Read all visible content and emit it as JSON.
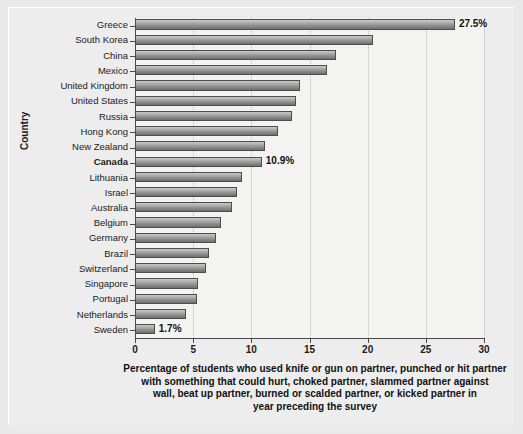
{
  "chart_data": {
    "type": "bar",
    "orientation": "horizontal",
    "title": "",
    "xlabel": "Percentage of students who used knife or gun on partner, punched or hit partner with something that could hurt, choked partner, slammed partner against wall, beat up partner, burned or scalded partner, or kicked partner in year preceding the survey",
    "ylabel": "Country",
    "xlim": [
      0,
      30
    ],
    "xticks": [
      0,
      5,
      10,
      15,
      20,
      25,
      30
    ],
    "xtick_labels": [
      "0",
      "5",
      "10",
      "15",
      "20",
      "25",
      "30"
    ],
    "grid": "vertical-dotted",
    "legend": "none",
    "categories": [
      "Greece",
      "South Korea",
      "China",
      "Mexico",
      "United Kingdom",
      "United States",
      "Russia",
      "Hong Kong",
      "New Zealand",
      "Canada",
      "Lithuania",
      "Israel",
      "Australia",
      "Belgium",
      "Germany",
      "Brazil",
      "Switzerland",
      "Singapore",
      "Portugal",
      "Netherlands",
      "Sweden"
    ],
    "values": [
      27.5,
      20.5,
      17.3,
      16.5,
      14.2,
      13.8,
      13.5,
      12.3,
      11.2,
      10.9,
      9.2,
      8.8,
      8.3,
      7.4,
      7.0,
      6.4,
      6.1,
      5.4,
      5.3,
      4.4,
      1.7
    ],
    "annotations": [
      {
        "category": "Greece",
        "text": "27.5%"
      },
      {
        "category": "Canada",
        "text": "10.9%"
      },
      {
        "category": "Sweden",
        "text": "1.7%"
      }
    ],
    "highlighted_category": "Canada"
  },
  "axis": {
    "y_title": "Country",
    "x_tick_labels": [
      "0",
      "5",
      "10",
      "15",
      "20",
      "25",
      "30"
    ]
  },
  "caption": {
    "line1": "Percentage of students who used knife or gun on partner, punched or hit partner",
    "line2": "with something that could hurt, choked partner, slammed partner against",
    "line3": "wall, beat up partner, burned or scalded partner, or kicked partner in",
    "line4": "year preceding the survey"
  },
  "colors": {
    "background": "#e9e9e9",
    "panel": "#f3f3f1",
    "bar_light": "#c9c9c9",
    "bar_dark": "#6f6f6f",
    "bar_border": "#4d4d4d",
    "axis": "#4a4a4a",
    "gridline": "#b9b9b9",
    "text": "#1a1a1a"
  }
}
